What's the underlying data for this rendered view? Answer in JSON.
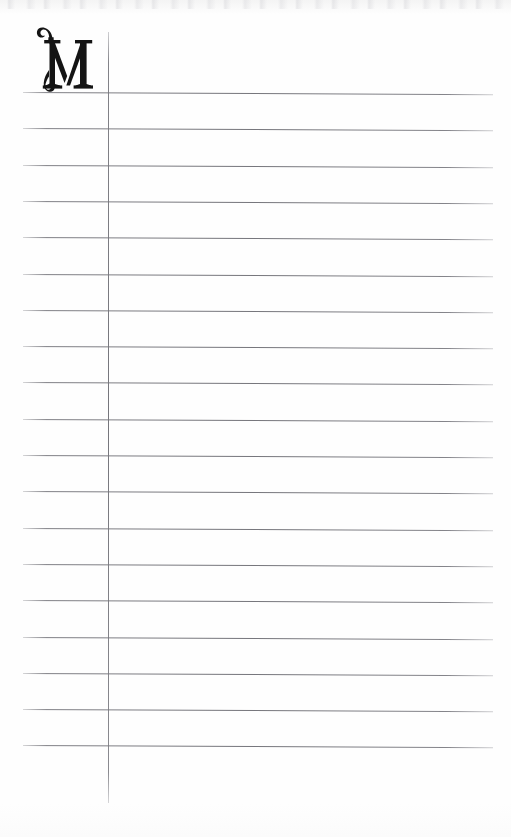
{
  "document": {
    "kind": "ruled-notebook-page",
    "title": "Blank ruled ledger page with ornamental initial",
    "page_width": 511,
    "page_height": 837,
    "background_color": "#fdfdfd",
    "paper_tone": "off-white scanned paper"
  },
  "initial": {
    "character": "M",
    "style": "ornamental swash capital",
    "color": "#111111",
    "left": 42,
    "top": 30,
    "width": 47,
    "height": 62,
    "description": "Decorative serif capital M with a curled swash flourish on the left stem"
  },
  "margin_rule": {
    "name": "vertical-margin-line",
    "x": 108,
    "y_start": 32,
    "y_end": 803,
    "color": "#76767c",
    "thickness": 1
  },
  "ruled_lines": {
    "count": 19,
    "x_start": 23,
    "x_end": 493,
    "first_y": 92,
    "spacing": 36.3,
    "slant_degrees": 0.26,
    "color": "#74747a",
    "thickness": 1,
    "positions": [
      92,
      128.3,
      164.6,
      200.9,
      237.2,
      273.5,
      309.8,
      346.1,
      382.4,
      418.7,
      455,
      491.3,
      527.6,
      563.9,
      600.2,
      636.5,
      672.8,
      709.1,
      745.4
    ]
  },
  "content": {
    "written_text": "",
    "note": "Page is blank apart from the ornamental initial"
  }
}
